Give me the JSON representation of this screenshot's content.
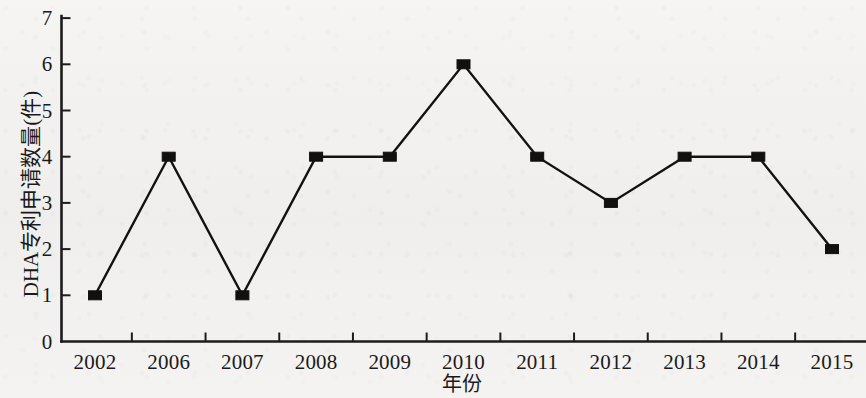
{
  "chart_data": {
    "type": "line",
    "title": "",
    "xlabel": "年份",
    "ylabel": "DHA专利申请数量(件)",
    "categories": [
      "2002",
      "2006",
      "2007",
      "2008",
      "2009",
      "2010",
      "2011",
      "2012",
      "2013",
      "2014",
      "2015"
    ],
    "values": [
      1,
      4,
      1,
      4,
      4,
      6,
      4,
      3,
      4,
      4,
      2
    ],
    "series": [
      {
        "name": "DHA专利申请数量",
        "values": [
          1,
          4,
          1,
          4,
          4,
          6,
          4,
          3,
          4,
          4,
          2
        ]
      }
    ],
    "ylim": [
      0,
      7
    ],
    "yticks": [
      "0",
      "1",
      "2",
      "3",
      "4",
      "5",
      "6",
      "7"
    ],
    "grid": false,
    "legend": false,
    "marker": "square",
    "line_color": "#121212",
    "marker_color": "#101010",
    "background_color": "#f2f1ef"
  },
  "axes": {
    "y_title": "DHA专利申请数量(件)",
    "x_title": "年份",
    "y_tick_labels": [
      "7",
      "6",
      "5",
      "4",
      "3",
      "2",
      "1",
      "0"
    ],
    "x_tick_labels": [
      "2002",
      "2006",
      "2007",
      "2008",
      "2009",
      "2010",
      "2011",
      "2012",
      "2013",
      "2014",
      "2015"
    ]
  }
}
